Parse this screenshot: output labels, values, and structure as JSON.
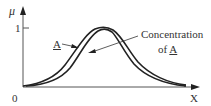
{
  "figure": {
    "y_axis_label": "μ",
    "x_axis_label": "X",
    "origin_label": "0",
    "y_tick_label": "1",
    "curve_label": "A",
    "annotation_line1": "Concentration",
    "annotation_line2_prefix": "of ",
    "annotation_line2_symbol": "A",
    "colors": {
      "curve": "#222222",
      "axis": "#444444",
      "text": "#333333"
    }
  },
  "diagram": {
    "type": "fuzzy membership function",
    "curves": [
      {
        "name": "A (lower bound)",
        "shape": "bell",
        "peak_value": 1
      },
      {
        "name": "A (upper bound)",
        "shape": "bell",
        "peak_value": 1
      }
    ],
    "y_range": [
      0,
      1
    ],
    "annotations": [
      "A",
      "Concentration of A"
    ]
  }
}
